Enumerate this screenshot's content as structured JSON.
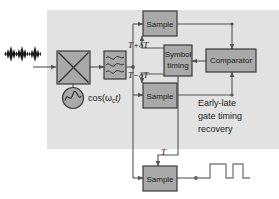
{
  "figure": {
    "type": "block-diagram",
    "title_text": "",
    "panel_label_lines": [
      "Early-late",
      "gate timing",
      "recovery"
    ],
    "colors": {
      "page_background": "#ffffff",
      "panel_fill": "#e2e2e2",
      "block_fill": "#a9a9a9",
      "block_stroke": "#3a3a3a",
      "wire": "#555555",
      "text": "#1a1a1a",
      "waveform": "#777777"
    }
  },
  "input": {
    "name": "modulated-pulse-train",
    "pulse_count": 3,
    "description": "diamond-envelope modulated pulses"
  },
  "blocks": {
    "mixer": {
      "label": "",
      "symbol": "multiplier-x"
    },
    "filter": {
      "label": "",
      "symbol": "bandpass-filter-waves"
    },
    "oscillator": {
      "label": "cos(ω",
      "sub": "c",
      "label_tail": "t)",
      "symbol": "sine-circle"
    },
    "sample_early": {
      "label": "Sample"
    },
    "sample_late": {
      "label": "Sample"
    },
    "sample_data": {
      "label": "Sample"
    },
    "symbol_timing": {
      "line1": "Symbol",
      "line2": "timing"
    },
    "comparator": {
      "label": "Comparator"
    }
  },
  "signal_labels": {
    "early": "T+δT",
    "late": "T−δT",
    "data_clock": "T"
  },
  "output": {
    "name": "digital-bit-stream",
    "description": "square-wave pulse train output"
  }
}
